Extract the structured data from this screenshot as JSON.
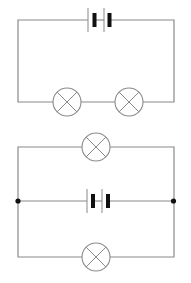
{
  "diagram": {
    "canvas": {
      "width": 191,
      "height": 283,
      "background": "#ffffff"
    },
    "colors": {
      "wire": "#8a8a8a",
      "thick_plate": "#111111",
      "junction": "#111111"
    },
    "circuits": [
      {
        "name": "series-circuit",
        "components": [
          {
            "type": "battery",
            "cells": 2,
            "position": "top-wire"
          },
          {
            "type": "lamp",
            "position": "bottom-wire-left"
          },
          {
            "type": "lamp",
            "position": "bottom-wire-right"
          }
        ]
      },
      {
        "name": "parallel-circuit",
        "components": [
          {
            "type": "lamp",
            "position": "top-branch"
          },
          {
            "type": "battery",
            "cells": 2,
            "position": "middle-branch"
          },
          {
            "type": "lamp",
            "position": "bottom-branch"
          },
          {
            "type": "junction",
            "position": "left"
          },
          {
            "type": "junction",
            "position": "right"
          }
        ]
      }
    ]
  }
}
